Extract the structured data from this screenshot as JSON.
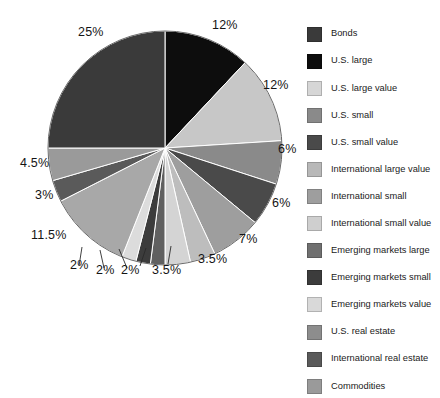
{
  "chart_data": {
    "type": "pie",
    "title": "",
    "subtitle": "",
    "xlabel": "",
    "ylabel": "",
    "legend_position": "right",
    "grid": false,
    "total": 100,
    "units": "%",
    "start_angle_deg": 0,
    "direction": "clockwise",
    "categories": [
      "U.S. large",
      "U.S. large value",
      "U.S. small",
      "U.S. small value",
      "International large value",
      "International small",
      "International small value",
      "Emerging markets large",
      "Emerging markets small",
      "Emerging markets value",
      "U.S. real estate",
      "International real estate",
      "Commodities",
      "Bonds"
    ],
    "values": [
      12,
      12,
      6,
      6,
      7,
      3.5,
      3.5,
      2,
      2,
      2,
      11.5,
      3,
      4.5,
      25
    ],
    "slices": [
      {
        "label": "U.S. large",
        "value": 12,
        "display": "12%",
        "color": "#0d0d0d"
      },
      {
        "label": "U.S. large value",
        "value": 12,
        "display": "12%",
        "color": "#c7c7c7"
      },
      {
        "label": "U.S. small",
        "value": 6,
        "display": "6%",
        "color": "#8a8a8a"
      },
      {
        "label": "U.S. small value",
        "value": 6,
        "display": "6%",
        "color": "#4a4a4a"
      },
      {
        "label": "International large value",
        "value": 7,
        "display": "7%",
        "color": "#9e9e9e"
      },
      {
        "label": "International small",
        "value": 3.5,
        "display": "3.5%",
        "color": "#bdbdbd"
      },
      {
        "label": "International small value",
        "value": 3.5,
        "display": "3.5%",
        "color": "#d4d4d4"
      },
      {
        "label": "Emerging markets large",
        "value": 2,
        "display": "2%",
        "color": "#606060"
      },
      {
        "label": "Emerging markets small",
        "value": 2,
        "display": "2%",
        "color": "#3c3c3c"
      },
      {
        "label": "Emerging markets value",
        "value": 2,
        "display": "2%",
        "color": "#dcdcdc"
      },
      {
        "label": "U.S. real estate",
        "value": 11.5,
        "display": "11.5%",
        "color": "#a8a8a8"
      },
      {
        "label": "International real estate",
        "value": 3,
        "display": "3%",
        "color": "#5a5a5a"
      },
      {
        "label": "Commodities",
        "value": 4.5,
        "display": "4.5%",
        "color": "#9a9a9a"
      },
      {
        "label": "Bonds",
        "value": 25,
        "display": "25%",
        "color": "#3a3a3a"
      }
    ],
    "data_labels": [
      {
        "text": "12%",
        "x": 212,
        "y": 18
      },
      {
        "text": "12%",
        "x": 263,
        "y": 78
      },
      {
        "text": "6%",
        "x": 278,
        "y": 142
      },
      {
        "text": "6%",
        "x": 272,
        "y": 196
      },
      {
        "text": "7%",
        "x": 239,
        "y": 232
      },
      {
        "text": "3.5%",
        "x": 198,
        "y": 252
      },
      {
        "text": "3.5%",
        "x": 152,
        "y": 263
      },
      {
        "text": "2%",
        "x": 121,
        "y": 263
      },
      {
        "text": "2%",
        "x": 96,
        "y": 263
      },
      {
        "text": "2%",
        "x": 70,
        "y": 258
      },
      {
        "text": "11.5%",
        "x": 31,
        "y": 228
      },
      {
        "text": "3%",
        "x": 35,
        "y": 188
      },
      {
        "text": "4.5%",
        "x": 20,
        "y": 156
      },
      {
        "text": "25%",
        "x": 78,
        "y": 25
      }
    ]
  },
  "legend": {
    "items": [
      {
        "label": "Bonds",
        "color": "#3a3a3a"
      },
      {
        "label": "U.S. large",
        "color": "#0d0d0d"
      },
      {
        "label": "U.S. large value",
        "color": "#d6d6d6"
      },
      {
        "label": "U.S. small",
        "color": "#8a8a8a"
      },
      {
        "label": "U.S. small value",
        "color": "#4a4a4a"
      },
      {
        "label": "International large value",
        "color": "#b8b8b8"
      },
      {
        "label": "International small",
        "color": "#9e9e9e"
      },
      {
        "label": "International small value",
        "color": "#cfcfcf"
      },
      {
        "label": "Emerging markets large",
        "color": "#707070"
      },
      {
        "label": "Emerging markets small",
        "color": "#3c3c3c"
      },
      {
        "label": "Emerging markets value",
        "color": "#d9d9d9"
      },
      {
        "label": "U.S. real estate",
        "color": "#8d8d8d"
      },
      {
        "label": "International real estate",
        "color": "#5a5a5a"
      },
      {
        "label": "Commodities",
        "color": "#9a9a9a"
      }
    ]
  },
  "geometry": {
    "center_x": 165,
    "center_y": 148,
    "radius": 117
  }
}
